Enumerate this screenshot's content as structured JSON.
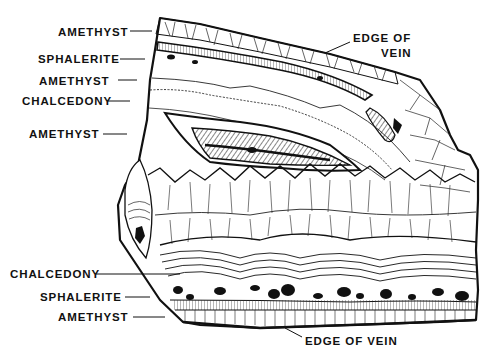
{
  "diagram": {
    "colors": {
      "ink": "#111111",
      "background": "#ffffff"
    },
    "labels_left": [
      {
        "id": "amethyst-1",
        "text": "AMETHYST",
        "x": 58,
        "y": 26,
        "line": [
          130,
          31,
          152,
          31
        ]
      },
      {
        "id": "sphalerite-1",
        "text": "SPHALERITE",
        "x": 38,
        "y": 53,
        "line": [
          120,
          59,
          145,
          59
        ]
      },
      {
        "id": "amethyst-2",
        "text": "AMETHYST",
        "x": 39,
        "y": 75,
        "line": [
          118,
          80,
          137,
          80
        ]
      },
      {
        "id": "chalcedony-1",
        "text": "CHALCEDONY",
        "x": 22,
        "y": 95,
        "line": [
          108,
          101,
          130,
          101
        ]
      },
      {
        "id": "amethyst-3",
        "text": "AMETHYST",
        "x": 29,
        "y": 127,
        "line": [
          103,
          134,
          127,
          134
        ]
      },
      {
        "id": "chalcedony-2",
        "text": "CHALCEDONY",
        "x": 10,
        "y": 268,
        "line": [
          96,
          274,
          180,
          274
        ]
      },
      {
        "id": "sphalerite-2",
        "text": "SPHALERITE",
        "x": 40,
        "y": 291,
        "line": [
          125,
          297,
          150,
          297
        ]
      },
      {
        "id": "amethyst-4",
        "text": "AMETHYST",
        "x": 58,
        "y": 311,
        "line": [
          133,
          317,
          165,
          317
        ]
      }
    ],
    "labels_right": [
      {
        "id": "edge-of-vein-top-1",
        "text": "EDGE OF",
        "x": 353,
        "y": 32
      },
      {
        "id": "edge-of-vein-top-2",
        "text": "VEIN",
        "x": 381,
        "y": 47
      },
      {
        "id": "edge-of-vein-bottom",
        "text": "EDGE OF VEIN",
        "x": 305,
        "y": 335
      }
    ],
    "leaders": {
      "edge_top": [
        350,
        42,
        325,
        53
      ],
      "edge_bottom": [
        302,
        337,
        285,
        328
      ]
    }
  }
}
